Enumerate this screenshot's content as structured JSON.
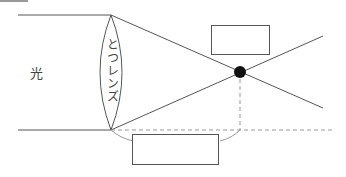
{
  "diagram": {
    "light_label": "光",
    "lens_label": "とつレンズ",
    "answer_box_top": "",
    "answer_box_bottom": "",
    "colors": {
      "line": "#555555",
      "dashed": "#999999",
      "focal_point": "#111111",
      "box_border": "#555555"
    }
  }
}
